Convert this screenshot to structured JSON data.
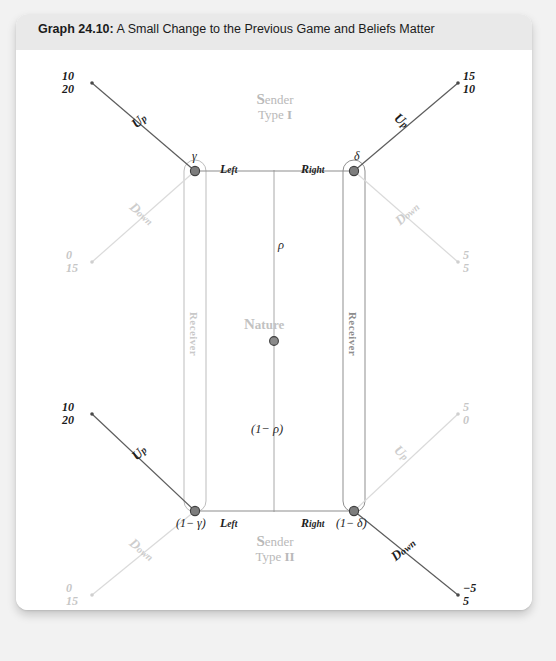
{
  "header": {
    "graph_number": "Graph 24.10:",
    "title": "A Small Change to the Previous Game and Beliefs Matter"
  },
  "players": {
    "sender_top_line1": "Sender",
    "sender_top_line2": "Type I",
    "sender_top_cap": "S",
    "sender_top_type": "I",
    "sender_bottom_line1": "Sender",
    "sender_bottom_line2": "Type II",
    "sender_bottom_cap": "S",
    "sender_bottom_type": "II",
    "nature": "Nature",
    "nature_cap": "N",
    "receiver_left": "Receiver",
    "receiver_right": "Receiver"
  },
  "nature_branches": {
    "top_prob": "ρ",
    "bottom_prob": "(1− ρ)"
  },
  "nodes": {
    "top_left": "γ",
    "top_right": "δ",
    "bottom_left": "(1− γ)",
    "bottom_right": "(1− δ)"
  },
  "message_labels": {
    "top_left": {
      "cap": "L",
      "rest": "eft"
    },
    "top_right": {
      "cap": "R",
      "rest": "ight"
    },
    "bottom_left": {
      "cap": "L",
      "rest": "eft"
    },
    "bottom_right": {
      "cap": "R",
      "rest": "ight"
    }
  },
  "actions": [
    {
      "id": "tl-up",
      "cap": "U",
      "rest": "p",
      "style": "dark"
    },
    {
      "id": "tl-down",
      "cap": "D",
      "rest": "own",
      "style": "faded"
    },
    {
      "id": "tr-up",
      "cap": "U",
      "rest": "p",
      "style": "dark"
    },
    {
      "id": "tr-down",
      "cap": "D",
      "rest": "own",
      "style": "faded"
    },
    {
      "id": "bl-up",
      "cap": "U",
      "rest": "p",
      "style": "dark"
    },
    {
      "id": "bl-down",
      "cap": "D",
      "rest": "own",
      "style": "faded"
    },
    {
      "id": "br-up",
      "cap": "U",
      "rest": "p",
      "style": "faded"
    },
    {
      "id": "br-down",
      "cap": "D",
      "rest": "own",
      "style": "dark"
    }
  ],
  "payoffs": [
    {
      "id": "tl-up",
      "top": "10",
      "bottom": "20",
      "style": "dark"
    },
    {
      "id": "tl-down",
      "top": "0",
      "bottom": "15",
      "style": "faded"
    },
    {
      "id": "tr-up",
      "top": "15",
      "bottom": "10",
      "style": "dark"
    },
    {
      "id": "tr-down",
      "top": "5",
      "bottom": "5",
      "style": "faded"
    },
    {
      "id": "bl-up",
      "top": "10",
      "bottom": "20",
      "style": "dark"
    },
    {
      "id": "bl-down",
      "top": "0",
      "bottom": "15",
      "style": "faded"
    },
    {
      "id": "br-up",
      "top": "5",
      "bottom": "0",
      "style": "faded"
    },
    {
      "id": "br-down",
      "top": "−5",
      "bottom": "5",
      "style": "dark"
    }
  ],
  "colors": {
    "dark_line": "#5c5c5c",
    "faded_line": "#d8d8d8",
    "mid_line": "#9a9a9a",
    "card_bg": "#ffffff",
    "header_bg": "#e9e9e9",
    "page_bg": "#f2f2f2"
  }
}
